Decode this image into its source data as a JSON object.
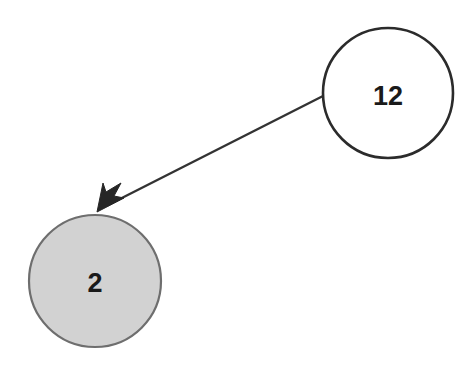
{
  "diagram": {
    "type": "directed-graph",
    "background_color": "#ffffff",
    "width": 473,
    "height": 377,
    "nodes": [
      {
        "id": "n12",
        "label": "12",
        "shape": "circle",
        "cx": 388,
        "cy": 93,
        "r": 65,
        "fill": "#ffffff",
        "stroke": "#2b2b2b",
        "stroke_width": 2.6,
        "label_color": "#1a1a1a",
        "name": "node-12"
      },
      {
        "id": "n2",
        "label": "2",
        "shape": "circle",
        "cx": 95,
        "cy": 281,
        "r": 66,
        "fill": "#d2d2d2",
        "stroke": "#6e6e6e",
        "stroke_width": 2.2,
        "label_color": "#1a1a1a",
        "name": "node-2"
      }
    ],
    "edges": [
      {
        "id": "e1",
        "from": "n12",
        "to": "n2",
        "label": "",
        "directed": true,
        "x1": 323,
        "y1": 96,
        "x2": 99,
        "y2": 210,
        "stroke": "#333333",
        "stroke_width": 2.4,
        "arrowhead": "solid-barbed",
        "name": "edge-12-to-2"
      }
    ]
  }
}
